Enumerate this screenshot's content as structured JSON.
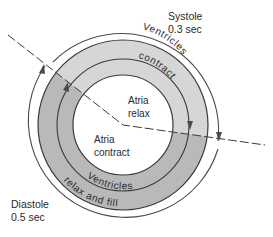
{
  "diagram": {
    "systole": {
      "label": "Systole",
      "duration": "0.3 sec"
    },
    "diastole": {
      "label": "Diastole",
      "duration": "0.5 sec"
    },
    "outer_ring": {
      "systole_text": "Ventricles",
      "systole_text2": "contract",
      "diastole_text": "Ventricles",
      "diastole_text2": "relax and fill"
    },
    "inner_circle": {
      "upper_line1": "Atria",
      "upper_line2": "relax",
      "lower_line1": "Atria",
      "lower_line2": "contract"
    },
    "colors": {
      "systole_fill": "#d6d6d6",
      "diastole_fill": "#b9b9b9",
      "stroke": "#3a3a3a"
    }
  }
}
